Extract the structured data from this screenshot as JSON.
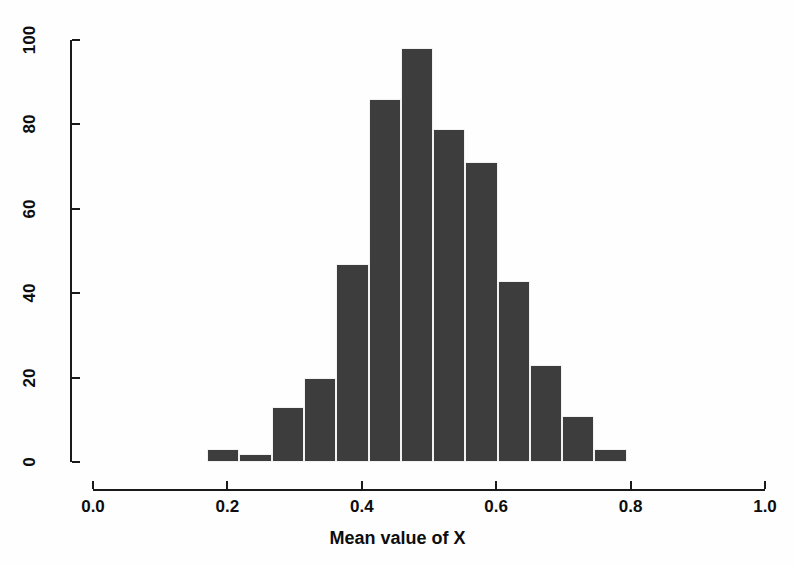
{
  "chart_data": {
    "type": "bar",
    "title": "",
    "subtitle": "",
    "xlabel": "Mean value of X",
    "ylabel": "Number of samples",
    "xlim": [
      0.0,
      1.0
    ],
    "ylim": [
      0,
      100
    ],
    "grid": false,
    "legend": null,
    "bin_width": 0.048,
    "bin_starts": [
      0.17,
      0.218,
      0.266,
      0.314,
      0.362,
      0.41,
      0.458,
      0.506,
      0.554,
      0.602,
      0.65,
      0.698,
      0.746
    ],
    "categories": [
      "0.17–0.22",
      "0.22–0.27",
      "0.27–0.31",
      "0.31–0.36",
      "0.36–0.41",
      "0.41–0.46",
      "0.46–0.51",
      "0.51–0.55",
      "0.55–0.60",
      "0.60–0.65",
      "0.65–0.70",
      "0.70–0.75",
      "0.75–0.79"
    ],
    "values": [
      3,
      2,
      13,
      20,
      47,
      86,
      98,
      79,
      71,
      43,
      23,
      11,
      3
    ],
    "x_ticks": [
      "0.0",
      "0.2",
      "0.4",
      "0.6",
      "0.8",
      "1.0"
    ],
    "x_tick_values": [
      0.0,
      0.2,
      0.4,
      0.6,
      0.8,
      1.0
    ],
    "y_ticks": [
      "0",
      "20",
      "40",
      "60",
      "80",
      "100"
    ],
    "y_tick_values": [
      0,
      20,
      40,
      60,
      80,
      100
    ],
    "bar_color": "#3d3d3d",
    "axis_color": "#1a1a1a",
    "background_color": "#fefefe"
  }
}
